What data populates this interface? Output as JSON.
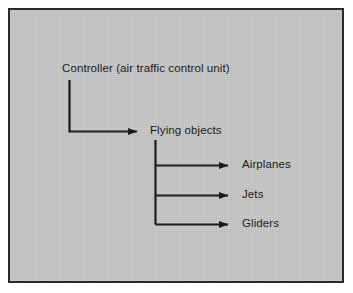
{
  "figure": {
    "kind": "hierarchy-diagram",
    "background_color": "#ffffff",
    "panel_color": "#c3c3c3",
    "border_color": "#2b2b2b",
    "line_color": "#1c1c1c",
    "text_color": "#1c1c1c"
  },
  "nodes": {
    "controller": {
      "label": "Controller (air traffic control unit)"
    },
    "flying_objects": {
      "label": "Flying objects"
    },
    "airplanes": {
      "label": "Airplanes"
    },
    "jets": {
      "label": "Jets"
    },
    "gliders": {
      "label": "Gliders"
    }
  },
  "connectors": [
    {
      "from": "controller",
      "to": "flying_objects",
      "style": "elbow-down-right",
      "arrow": true
    },
    {
      "from": "flying_objects",
      "to": "airplanes",
      "style": "elbow-down-right",
      "arrow": true
    },
    {
      "from": "flying_objects",
      "to": "jets",
      "style": "elbow-down-right",
      "arrow": true
    },
    {
      "from": "flying_objects",
      "to": "gliders",
      "style": "elbow-down-right",
      "arrow": true
    }
  ]
}
